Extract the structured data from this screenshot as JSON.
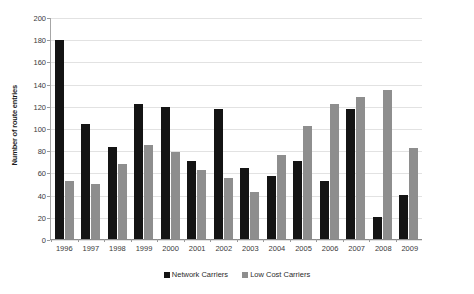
{
  "chart_data": {
    "type": "bar",
    "title": "",
    "xlabel": "",
    "ylabel": "Number of route entries",
    "ylim": [
      0,
      200
    ],
    "ytick_step": 20,
    "yticks": [
      200,
      180,
      160,
      140,
      120,
      100,
      80,
      60,
      40,
      20,
      0
    ],
    "grid": true,
    "legend_position": "bottom-center",
    "categories": [
      "1996",
      "1997",
      "1998",
      "1999",
      "2000",
      "2001",
      "2002",
      "2003",
      "2004",
      "2005",
      "2006",
      "2007",
      "2008",
      "2009"
    ],
    "series": [
      {
        "name": "Network Carriers",
        "color": "#141414",
        "values": [
          179,
          104,
          83,
          122,
          119,
          70,
          117,
          64,
          57,
          70,
          52,
          117,
          20,
          40
        ]
      },
      {
        "name": "Low Cost Carriers",
        "color": "#8e8e8e",
        "values": [
          52,
          50,
          68,
          85,
          78,
          62,
          55,
          42,
          76,
          102,
          122,
          128,
          134,
          82
        ]
      }
    ]
  }
}
